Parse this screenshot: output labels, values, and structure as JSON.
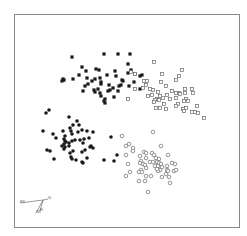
{
  "chart_data": {
    "type": "scatter",
    "title": "",
    "xlabel": "",
    "ylabel": "",
    "grid": false,
    "legend": null,
    "frame": {
      "x0": 14,
      "y0": 14,
      "x1": 239,
      "y1": 227,
      "color": "#8a8a8a"
    },
    "coordinate_note": "points given in image pixel coordinates (x right, y down)",
    "series": [
      {
        "name": "cluster-1",
        "marker": "filled-square",
        "color": "#1a1a1a",
        "points": [
          [
            72,
            57
          ],
          [
            104,
            54
          ],
          [
            118,
            54
          ],
          [
            130,
            54
          ],
          [
            128,
            64
          ],
          [
            82,
            67
          ],
          [
            63,
            79
          ],
          [
            64,
            80
          ],
          [
            73,
            79
          ],
          [
            79,
            75
          ],
          [
            86,
            71
          ],
          [
            96,
            69
          ],
          [
            99,
            70
          ],
          [
            87,
            78
          ],
          [
            92,
            81
          ],
          [
            95,
            79
          ],
          [
            100,
            78
          ],
          [
            101,
            82
          ],
          [
            107,
            75
          ],
          [
            109,
            85
          ],
          [
            115,
            71
          ],
          [
            116,
            76
          ],
          [
            121,
            85
          ],
          [
            122,
            80
          ],
          [
            119,
            86
          ],
          [
            113,
            88
          ],
          [
            110,
            90
          ],
          [
            101,
            84
          ],
          [
            98,
            89
          ],
          [
            95,
            92
          ],
          [
            100,
            93
          ],
          [
            101,
            96
          ],
          [
            105,
            99
          ],
          [
            105,
            103
          ],
          [
            108,
            91
          ],
          [
            114,
            97
          ],
          [
            118,
            91
          ],
          [
            85,
            86
          ],
          [
            83,
            91
          ],
          [
            94,
            90
          ],
          [
            88,
            84
          ],
          [
            128,
            73
          ],
          [
            131,
            70
          ],
          [
            135,
            74
          ],
          [
            140,
            76
          ],
          [
            142,
            75
          ],
          [
            129,
            86
          ],
          [
            134,
            82
          ],
          [
            140,
            89
          ],
          [
            123,
            81
          ],
          [
            104,
            101
          ],
          [
            62,
            81
          ]
        ]
      },
      {
        "name": "cluster-2",
        "marker": "open-square",
        "color": "#6a6a6a",
        "points": [
          [
            154,
            62
          ],
          [
            131,
            72
          ],
          [
            135,
            74
          ],
          [
            144,
            81
          ],
          [
            147,
            81
          ],
          [
            162,
            74
          ],
          [
            182,
            70
          ],
          [
            179,
            76
          ],
          [
            176,
            80
          ],
          [
            166,
            86
          ],
          [
            161,
            82
          ],
          [
            167,
            95
          ],
          [
            157,
            99
          ],
          [
            155,
            100
          ],
          [
            159,
            100
          ],
          [
            154,
            102
          ],
          [
            164,
            104
          ],
          [
            160,
            108
          ],
          [
            156,
            108
          ],
          [
            163,
            98
          ],
          [
            172,
            91
          ],
          [
            170,
            99
          ],
          [
            176,
            98
          ],
          [
            176,
            93
          ],
          [
            179,
            93
          ],
          [
            180,
            94
          ],
          [
            185,
            93
          ],
          [
            185,
            89
          ],
          [
            192,
            89
          ],
          [
            193,
            93
          ],
          [
            186,
            99
          ],
          [
            184,
            101
          ],
          [
            188,
            101
          ],
          [
            178,
            104
          ],
          [
            176,
            106
          ],
          [
            186,
            108
          ],
          [
            183,
            109
          ],
          [
            166,
            109
          ],
          [
            158,
            92
          ],
          [
            148,
            96
          ],
          [
            153,
            90
          ],
          [
            143,
            88
          ],
          [
            135,
            89
          ],
          [
            128,
            99
          ],
          [
            146,
            85
          ],
          [
            197,
            106
          ],
          [
            195,
            112
          ],
          [
            192,
            112
          ],
          [
            198,
            113
          ],
          [
            184,
            111
          ],
          [
            204,
            118
          ],
          [
            150,
            89
          ],
          [
            152,
            95
          ],
          [
            160,
            96
          ]
        ]
      },
      {
        "name": "cluster-3",
        "marker": "filled-circle",
        "color": "#1a1a1a",
        "points": [
          [
            49,
            110
          ],
          [
            46,
            113
          ],
          [
            69,
            117
          ],
          [
            73,
            125
          ],
          [
            77,
            121
          ],
          [
            79,
            125
          ],
          [
            70,
            128
          ],
          [
            71,
            131
          ],
          [
            43,
            131
          ],
          [
            53,
            134
          ],
          [
            63,
            131
          ],
          [
            65,
            136
          ],
          [
            72,
            134
          ],
          [
            78,
            132
          ],
          [
            82,
            130
          ],
          [
            87,
            131
          ],
          [
            93,
            132
          ],
          [
            56,
            138
          ],
          [
            64,
            139
          ],
          [
            65,
            141
          ],
          [
            66,
            142
          ],
          [
            69,
            143
          ],
          [
            72,
            141
          ],
          [
            75,
            140
          ],
          [
            80,
            140
          ],
          [
            84,
            139
          ],
          [
            89,
            138
          ],
          [
            91,
            146
          ],
          [
            83,
            143
          ],
          [
            64,
            144
          ],
          [
            65,
            147
          ],
          [
            69,
            146
          ],
          [
            73,
            151
          ],
          [
            85,
            150
          ],
          [
            82,
            152
          ],
          [
            90,
            147
          ],
          [
            93,
            148
          ],
          [
            47,
            150
          ],
          [
            50,
            151
          ],
          [
            54,
            159
          ],
          [
            64,
            149
          ],
          [
            70,
            153
          ],
          [
            71,
            157
          ],
          [
            72,
            159
          ],
          [
            76,
            160
          ],
          [
            82,
            162
          ],
          [
            83,
            163
          ],
          [
            87,
            158
          ],
          [
            62,
            146
          ],
          [
            111,
            137
          ],
          [
            117,
            155
          ],
          [
            114,
            161
          ],
          [
            104,
            160
          ]
        ]
      },
      {
        "name": "cluster-4",
        "marker": "open-circle",
        "color": "#6a6a6a",
        "points": [
          [
            153,
            132
          ],
          [
            122,
            136
          ],
          [
            129,
            144
          ],
          [
            126,
            146
          ],
          [
            133,
            148
          ],
          [
            126,
            155
          ],
          [
            128,
            164
          ],
          [
            130,
            172
          ],
          [
            126,
            176
          ],
          [
            161,
            146
          ],
          [
            133,
            151
          ],
          [
            140,
            156
          ],
          [
            144,
            152
          ],
          [
            146,
            153
          ],
          [
            141,
            161
          ],
          [
            140,
            163
          ],
          [
            143,
            164
          ],
          [
            145,
            165
          ],
          [
            146,
            168
          ],
          [
            141,
            170
          ],
          [
            139,
            172
          ],
          [
            142,
            172
          ],
          [
            146,
            176
          ],
          [
            150,
            162
          ],
          [
            152,
            153
          ],
          [
            154,
            155
          ],
          [
            156,
            158
          ],
          [
            157,
            162
          ],
          [
            155,
            166
          ],
          [
            153,
            162
          ],
          [
            159,
            159
          ],
          [
            159,
            163
          ],
          [
            161,
            164
          ],
          [
            158,
            166
          ],
          [
            162,
            167
          ],
          [
            160,
            170
          ],
          [
            167,
            166
          ],
          [
            167,
            170
          ],
          [
            168,
            171
          ],
          [
            166,
            174
          ],
          [
            172,
            163
          ],
          [
            162,
            177
          ],
          [
            169,
            177
          ],
          [
            174,
            171
          ],
          [
            176,
            170
          ],
          [
            168,
            155
          ],
          [
            175,
            164
          ],
          [
            158,
            171
          ],
          [
            145,
            181
          ],
          [
            151,
            176
          ],
          [
            139,
            181
          ],
          [
            170,
            183
          ],
          [
            148,
            192
          ],
          [
            146,
            158
          ],
          [
            157,
            169
          ]
        ]
      }
    ],
    "axis_glyph": {
      "origin": [
        43,
        200
      ],
      "arrows": [
        {
          "to": [
            20,
            203
          ],
          "label": "PW"
        },
        {
          "to": [
            48,
            199
          ],
          "label": "SL"
        },
        {
          "to": [
            36,
            213
          ],
          "label": "SW"
        },
        {
          "to": [
            40,
            211
          ],
          "label": "PL"
        }
      ],
      "color": "#555555"
    }
  }
}
